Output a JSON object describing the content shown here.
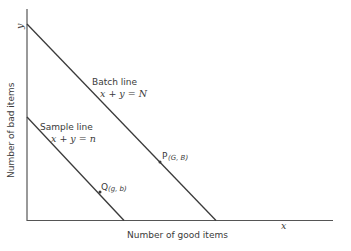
{
  "axes": {
    "x_symbol": "x",
    "y_symbol": "y",
    "x_label": "Number of good items",
    "y_label": "Number of bad items"
  },
  "batch_line": {
    "name": "Batch line",
    "equation": "x + y = N"
  },
  "sample_line": {
    "name": "Sample line",
    "equation": "x + y = n"
  },
  "points": {
    "P": {
      "letter": "P",
      "coords": "(G, B)"
    },
    "Q": {
      "letter": "Q",
      "coords": "(g, b)"
    }
  },
  "colors": {
    "line": "#3a3a3a",
    "axis": "#555555",
    "background": "#ffffff"
  }
}
